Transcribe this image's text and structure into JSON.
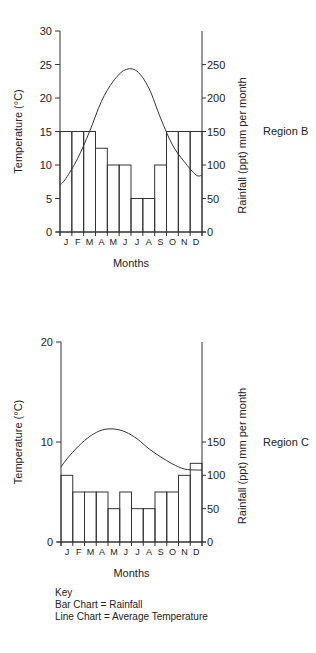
{
  "chart_data": [
    {
      "type": "bar+line",
      "title": "Region B",
      "region_label": "Region B",
      "categories": [
        "J",
        "F",
        "M",
        "A",
        "M",
        "J",
        "J",
        "A",
        "S",
        "O",
        "N",
        "D"
      ],
      "xlabel": "Months",
      "ylabel": "Temperature (°C)",
      "y2label": "Rainfall (ppt) mm per month",
      "ylim": [
        0,
        30
      ],
      "y2lim": [
        0,
        300
      ],
      "yticks": [
        0,
        5,
        10,
        15,
        20,
        25,
        30
      ],
      "y2ticks": [
        0,
        50,
        100,
        150,
        200,
        250
      ],
      "series": [
        {
          "name": "Rainfall",
          "type": "bar",
          "axis": "right",
          "values": [
            150,
            150,
            150,
            125,
            100,
            100,
            50,
            50,
            100,
            150,
            150,
            150
          ]
        },
        {
          "name": "Average Temperature",
          "type": "line",
          "axis": "left",
          "values": [
            8,
            11,
            15,
            19.5,
            22.5,
            24.2,
            24,
            21.5,
            17,
            13,
            10.5,
            8.5
          ],
          "start": 7,
          "end": 8.5
        }
      ],
      "grid": false
    },
    {
      "type": "bar+line",
      "title": "Region C",
      "region_label": "Region C",
      "categories": [
        "J",
        "F",
        "M",
        "A",
        "M",
        "J",
        "J",
        "A",
        "S",
        "O",
        "N",
        "D"
      ],
      "xlabel": "Months",
      "ylabel": "Temperature (°C)",
      "y2label": "Rainfall (ppt) mm per month",
      "ylim": [
        0,
        20
      ],
      "y2lim": [
        0,
        300
      ],
      "yticks": [
        0,
        10,
        20
      ],
      "y2ticks": [
        0,
        50,
        100,
        150
      ],
      "series": [
        {
          "name": "Rainfall",
          "type": "bar",
          "axis": "right",
          "values": [
            100,
            75,
            75,
            75,
            50,
            75,
            50,
            50,
            75,
            75,
            100,
            118
          ]
        },
        {
          "name": "Average Temperature",
          "type": "line",
          "axis": "left",
          "values": [
            8.3,
            9.6,
            10.6,
            11.2,
            11.3,
            11,
            10.3,
            9.3,
            8.5,
            7.8,
            7.3,
            7.2
          ],
          "start": 7.5,
          "end": 7.2
        }
      ],
      "grid": false
    }
  ],
  "key": {
    "title": "Key",
    "bar": "Bar Chart = Rainfall",
    "line": "Line Chart = Average Temperature"
  }
}
